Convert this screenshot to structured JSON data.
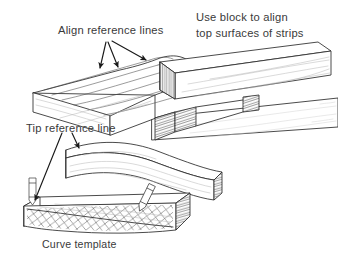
{
  "figure": {
    "background_color": "#ffffff",
    "ink_color": "#2b2b2b",
    "text_color": "#3a3a3a"
  },
  "annotations": {
    "align_reference_lines": "Align reference lines",
    "use_block_line1": "Use block to align",
    "use_block_line2": "top surfaces of strips",
    "tip_reference_line": "Tip reference line",
    "curve_template": "Curve template"
  },
  "parts": [
    {
      "name": "laminated-strip-stack",
      "description": "stack of bent laminate strips with concentric curved reference lines"
    },
    {
      "name": "alignment-block",
      "description": "rectangular block with end-grain hatching used to align tops of strips"
    },
    {
      "name": "lower-strip",
      "description": "strip passing beneath the alignment block extending to right edge"
    },
    {
      "name": "curved-strip",
      "description": "single shaped strip with concave top edge and end grain"
    },
    {
      "name": "curve-template",
      "description": "cross-hatched curve template block"
    },
    {
      "name": "pencil-left",
      "description": "upright pencil marking tip reference line"
    },
    {
      "name": "pencil-right",
      "description": "tilted pencil tracing the template curve"
    }
  ]
}
